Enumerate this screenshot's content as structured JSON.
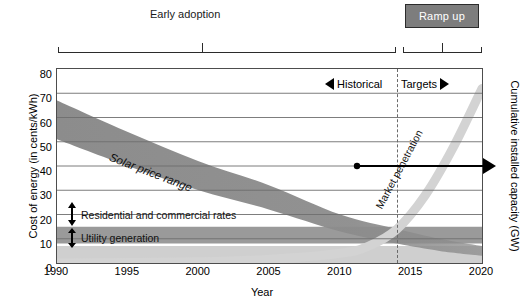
{
  "chart_data": {
    "type": "area",
    "title": "",
    "xlabel": "Year",
    "ylabel": "Cost of energy (in cents/kWh)",
    "ylabel_right": "Cumulative installed capacity (GW)",
    "xlim": [
      1990,
      2020
    ],
    "ylim": [
      0,
      80
    ],
    "grid": true,
    "legend_position": "inline-annotations",
    "x_ticks": [
      "1990",
      "1995",
      "2000",
      "2005",
      "2010",
      "2015",
      "2020"
    ],
    "y_ticks": [
      "0",
      "10",
      "20",
      "30",
      "40",
      "50",
      "60",
      "70",
      "80"
    ],
    "series": [
      {
        "name": "Solar price range",
        "kind": "band",
        "color": "#8c8c8c",
        "x": [
          1990,
          1995,
          2000,
          2005,
          2010,
          2014,
          2017,
          2020
        ],
        "upper": [
          67,
          54,
          42,
          32,
          20,
          14,
          10,
          7
        ],
        "lower": [
          51,
          40,
          30,
          22,
          13,
          8,
          5,
          3
        ]
      },
      {
        "name": "Residential and commercial rates",
        "kind": "band",
        "color": "#9a9a9a",
        "x": [
          1990,
          2020
        ],
        "upper": [
          15,
          15
        ],
        "lower": [
          8,
          8
        ]
      },
      {
        "name": "Utility generation",
        "kind": "band",
        "color": "#cfcfcf",
        "x": [
          1990,
          2020
        ],
        "upper": [
          7,
          7
        ],
        "lower": [
          0,
          0
        ]
      },
      {
        "name": "Market penetration",
        "kind": "curve",
        "color": "#d3d3d3",
        "axis": "right",
        "x": [
          1990,
          2000,
          2005,
          2010,
          2012,
          2014,
          2016,
          2018,
          2020
        ],
        "values": [
          0,
          0.5,
          1.5,
          4,
          7,
          14,
          28,
          48,
          72
        ]
      }
    ],
    "annotations": [
      {
        "name": "phase-early",
        "text": "Early adoption",
        "x_range": [
          1990,
          2014
        ]
      },
      {
        "name": "phase-ramp",
        "text": "Ramp up",
        "x_range": [
          2014,
          2020
        ]
      },
      {
        "name": "historical",
        "text": "Historical",
        "marker": "left-arrow"
      },
      {
        "name": "targets",
        "text": "Targets",
        "marker": "right-arrow"
      },
      {
        "name": "divider",
        "text": "",
        "x": 2014,
        "style": "dashed"
      },
      {
        "name": "capacity-arrow",
        "text": "",
        "x_range": [
          2017,
          2020
        ],
        "y": 40
      }
    ]
  },
  "axes": {
    "y_left_title": "Cost of energy (in cents/kWh)",
    "y_right_title": "Cumulative installed capacity (GW)",
    "x_title": "Year",
    "y_ticks": [
      {
        "value": 80,
        "label": "80"
      },
      {
        "value": 70,
        "label": "70"
      },
      {
        "value": 60,
        "label": "60"
      },
      {
        "value": 50,
        "label": "50"
      },
      {
        "value": 40,
        "label": "40"
      },
      {
        "value": 30,
        "label": "30"
      },
      {
        "value": 20,
        "label": "20"
      },
      {
        "value": 10,
        "label": "10"
      },
      {
        "value": 0,
        "label": "0"
      }
    ],
    "x_ticks": [
      {
        "value": 1990,
        "label": "1990"
      },
      {
        "value": 1995,
        "label": "1995"
      },
      {
        "value": 2000,
        "label": "2000"
      },
      {
        "value": 2005,
        "label": "2005"
      },
      {
        "value": 2010,
        "label": "2010"
      },
      {
        "value": 2015,
        "label": "2015"
      },
      {
        "value": 2020,
        "label": "2020"
      }
    ]
  },
  "labels": {
    "phase_early": "Early adoption",
    "phase_ramp": "Ramp up",
    "historical": "Historical",
    "targets": "Targets",
    "solar_band": "Solar price range",
    "market_penetration": "Market penetration",
    "residential": "Residential and commercial rates",
    "utility": "Utility generation"
  },
  "colors": {
    "solar_band": "#8c8c8c",
    "residential_band": "#9a9a9a",
    "utility_band": "#cfcfcf",
    "market_curve": "#d3d3d3",
    "ramp_box_fill": "#7d7d7d",
    "ramp_box_text": "#ffffff",
    "axis": "#4d4d4d",
    "grid": "#6e6e6e",
    "annotation": "#000000"
  }
}
